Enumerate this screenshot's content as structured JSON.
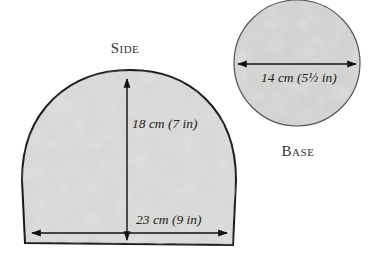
{
  "diagram": {
    "colors": {
      "fill": "#d6d6d4",
      "outline": "#1a1a1a",
      "circle_outline": "#555555",
      "arrow": "#111111",
      "text": "#222222"
    },
    "pieces": [
      {
        "id": "side",
        "label": "Side",
        "shape": "dome",
        "dimensions": [
          {
            "orientation": "vertical",
            "text": "18 cm (7 in)"
          },
          {
            "orientation": "horizontal",
            "text": "23 cm (9 in)"
          }
        ]
      },
      {
        "id": "base",
        "label": "Base",
        "shape": "circle",
        "dimensions": [
          {
            "orientation": "horizontal",
            "text": "14 cm (5½ in)"
          }
        ]
      }
    ]
  }
}
